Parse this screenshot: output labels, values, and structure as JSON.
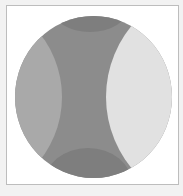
{
  "diagram": {
    "type": "circle-partition",
    "colors": {
      "background": "#f2f2f2",
      "frame": "#ffffff",
      "frame_border": "#bdbdbd",
      "left_region": "#a9a9a9",
      "center_region": "#8c8c8c",
      "right_region": "#e1e1e1",
      "top_cap": "#7e7e7e",
      "bottom_cap": "#7e7e7e"
    },
    "regions": [
      "left",
      "center",
      "right",
      "top-cap",
      "bottom-cap"
    ]
  }
}
